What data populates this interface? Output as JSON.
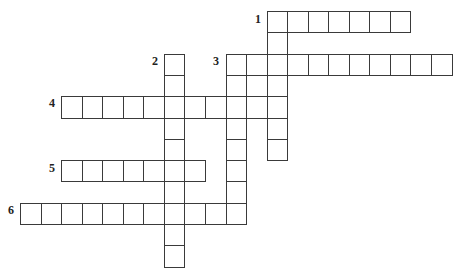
{
  "puzzle": {
    "type": "crossword",
    "grid": {
      "origin_x": 20,
      "origin_y": 11,
      "cell_width": 20.55,
      "cell_height": 21.3,
      "border_color": "#3a3a3a",
      "cell_fill": "#ffffff"
    },
    "entries": [
      {
        "number": "1",
        "direction": "across",
        "row": 0,
        "col": 12,
        "length": 7
      },
      {
        "number": "1",
        "direction": "down",
        "row": 0,
        "col": 12,
        "length": 7
      },
      {
        "number": "2",
        "direction": "down",
        "row": 2,
        "col": 7,
        "length": 10
      },
      {
        "number": "3",
        "direction": "across",
        "row": 2,
        "col": 10,
        "length": 11
      },
      {
        "number": "3",
        "direction": "down",
        "row": 2,
        "col": 10,
        "length": 8
      },
      {
        "number": "4",
        "direction": "across",
        "row": 4,
        "col": 2,
        "length": 11
      },
      {
        "number": "5",
        "direction": "across",
        "row": 7,
        "col": 2,
        "length": 7
      },
      {
        "number": "6",
        "direction": "across",
        "row": 9,
        "col": 0,
        "length": 10
      }
    ],
    "extra_cells": [
      {
        "row": 3,
        "col": 11
      }
    ],
    "labels": [
      {
        "number": "1",
        "x": 255,
        "y": 13
      },
      {
        "number": "2",
        "x": 152,
        "y": 55
      },
      {
        "number": "3",
        "x": 213,
        "y": 55
      },
      {
        "number": "4",
        "x": 49,
        "y": 97
      },
      {
        "number": "5",
        "x": 49,
        "y": 162
      },
      {
        "number": "6",
        "x": 8,
        "y": 204
      }
    ]
  }
}
